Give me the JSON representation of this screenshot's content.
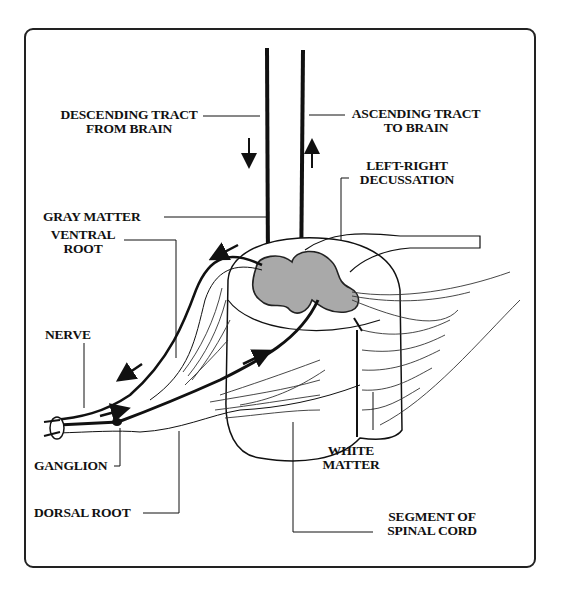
{
  "diagram": {
    "type": "anatomical illustration",
    "labels": {
      "descending_tract": [
        "DESCENDING TRACT",
        "FROM BRAIN"
      ],
      "ascending_tract": [
        "ASCENDING TRACT",
        "TO BRAIN"
      ],
      "decussation": [
        "LEFT-RIGHT",
        "DECUSSATION"
      ],
      "gray_matter": "GRAY MATTER",
      "ventral_root": [
        "VENTRAL",
        "ROOT"
      ],
      "nerve": "NERVE",
      "ganglion": "GANGLION",
      "dorsal_root": "DORSAL ROOT",
      "white_matter": [
        "WHITE",
        "MATTER"
      ],
      "segment": [
        "SEGMENT OF",
        "SPINAL CORD"
      ]
    },
    "colors": {
      "line": "#111111",
      "gray_matter_fill": "#a9a9a9",
      "background": "#ffffff"
    },
    "arrows": [
      {
        "name": "descending-arrow",
        "direction": "down"
      },
      {
        "name": "ascending-arrow",
        "direction": "up"
      },
      {
        "name": "ventral-out-arrow-upper",
        "direction": "down-left"
      },
      {
        "name": "ventral-out-arrow-lower",
        "direction": "down-left"
      },
      {
        "name": "dorsal-in-arrow-ganglion",
        "direction": "right"
      },
      {
        "name": "dorsal-in-arrow-cord",
        "direction": "up-right"
      }
    ]
  }
}
